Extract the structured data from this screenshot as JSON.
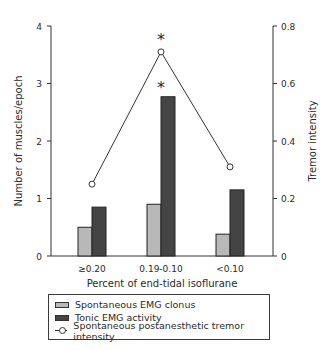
{
  "chart_data": {
    "type": "bar",
    "title": "",
    "xlabel": "Percent of end-tidal isoflurane",
    "ylabel": "Number of muscles/epoch",
    "y2label": "Tremor intensity",
    "categories": [
      "≥0.20",
      "0.19-0.10",
      "<0.10"
    ],
    "ylim": [
      0,
      4
    ],
    "y2lim": [
      0,
      0.8
    ],
    "yticks": [
      "0",
      "1",
      "2",
      "3",
      "4"
    ],
    "y2ticks": [
      "0",
      "0.2",
      "0.4",
      "0.6",
      "0.8"
    ],
    "series": [
      {
        "name": "Spontaneous EMG clonus",
        "type": "bar",
        "axis": "left",
        "color": "#b8b8b8",
        "values": [
          0.5,
          0.9,
          0.38
        ]
      },
      {
        "name": "Tonic EMG activity",
        "type": "bar",
        "axis": "left",
        "color": "#444444",
        "values": [
          0.85,
          2.77,
          1.15
        ]
      },
      {
        "name": "Spontaneous postanesthetic tremor intensity",
        "type": "line",
        "axis": "right",
        "marker": "open-circle",
        "values": [
          0.25,
          0.71,
          0.31
        ]
      }
    ],
    "annotations": [
      {
        "text": "*",
        "category": "0.19-0.10",
        "target": "Spontaneous postanesthetic tremor intensity"
      },
      {
        "text": "*",
        "category": "0.19-0.10",
        "target": "Tonic EMG activity"
      }
    ],
    "grid": false,
    "legend_position": "bottom"
  },
  "legend": {
    "items": [
      {
        "label": "Spontaneous EMG clonus"
      },
      {
        "label": "Tonic EMG activity"
      },
      {
        "label": "Spontaneous postanesthetic tremor intensity"
      }
    ]
  }
}
